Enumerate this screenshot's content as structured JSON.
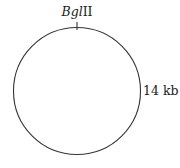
{
  "diagram": {
    "type": "plasmid-map",
    "shape": "circle",
    "stroke_color": "#333333",
    "restriction_site": {
      "enzyme_italic": "Bgl",
      "enzyme_roman": "II",
      "full_name": "BglII",
      "position": "top"
    },
    "size_label": "14 kb"
  }
}
